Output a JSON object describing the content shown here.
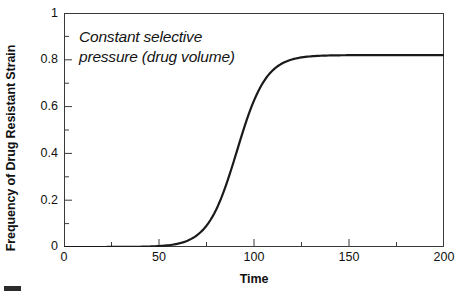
{
  "chart_data": {
    "type": "line",
    "title": "",
    "subtitle": "",
    "xlabel": "Time",
    "ylabel": "Frequency of Drug Resistant Strain",
    "xlim": [
      0,
      200
    ],
    "ylim": [
      0,
      1
    ],
    "grid": false,
    "legend": null,
    "legend_position": "none",
    "annotations": [
      {
        "text": "Constant selective\npressure (drug volume)",
        "style": "italic",
        "x": 8,
        "y": 0.93
      }
    ],
    "x_ticks_major": [
      0,
      50,
      100,
      150,
      200
    ],
    "x_tick_labels": [
      "0",
      "50",
      "100",
      "150",
      "200"
    ],
    "x_ticks_minor": [
      25,
      75,
      125,
      175
    ],
    "y_ticks_major": [
      0,
      0.2,
      0.4,
      0.6,
      0.8,
      1
    ],
    "y_tick_labels": [
      "0",
      "0.2",
      "0.4",
      "0.6",
      "0.8",
      "1"
    ],
    "y_ticks_minor": [
      0.1,
      0.3,
      0.5,
      0.7,
      0.9
    ],
    "series": [
      {
        "name": "Drug resistant strain frequency",
        "color": "#1a1a1a",
        "line_width": 2.2,
        "model": "logistic",
        "plateau": 0.82,
        "midpoint": 91,
        "steepness": 0.13,
        "x": [
          0,
          10,
          20,
          30,
          40,
          45,
          50,
          55,
          60,
          65,
          70,
          75,
          80,
          85,
          90,
          95,
          100,
          105,
          110,
          115,
          120,
          125,
          130,
          140,
          150,
          160,
          170,
          180,
          190,
          200
        ],
        "values": [
          0.0,
          0.0,
          0.001,
          0.002,
          0.007,
          0.013,
          0.025,
          0.046,
          0.083,
          0.143,
          0.232,
          0.346,
          0.468,
          0.579,
          0.665,
          0.724,
          0.762,
          0.786,
          0.8,
          0.808,
          0.813,
          0.816,
          0.818,
          0.819,
          0.82,
          0.82,
          0.82,
          0.82,
          0.82,
          0.82
        ]
      }
    ]
  },
  "axes": {
    "x_title": "Time",
    "y_title": "Frequency of Drug Resistant Strain",
    "x_tick_labels": [
      "0",
      "50",
      "100",
      "150",
      "200"
    ],
    "y_tick_labels": [
      "1",
      "0.8",
      "0.6",
      "0.4",
      "0.2",
      "0"
    ]
  },
  "annotation": {
    "line1": "Constant selective",
    "line2": "pressure (drug volume)",
    "full": "Constant selective\npressure (drug volume)"
  },
  "colors": {
    "curve": "#1a1a1a",
    "frame": "#3a3a3a",
    "background": "#ffffff",
    "text": "#111111"
  }
}
